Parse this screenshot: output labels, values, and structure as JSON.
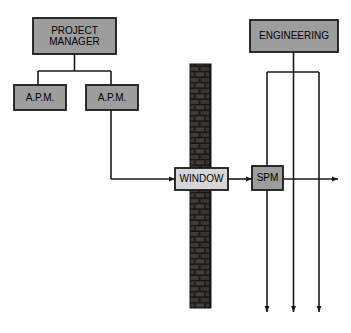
{
  "diagram": {
    "colors": {
      "box_fill": "#9d9d9d",
      "window_fill": "#d6d6d6",
      "stroke": "#1a1a1a",
      "wall_dark": "#1c1a19",
      "wall_brick": "#3a3533",
      "background": "#ffffff"
    },
    "nodes": [
      {
        "id": "project-manager",
        "label": "PROJECT\nMANAGER",
        "x": 33,
        "y": 18,
        "w": 83,
        "h": 36,
        "fill": "#9d9d9d"
      },
      {
        "id": "apm-left",
        "label": "A.P.M.",
        "x": 14,
        "y": 85,
        "w": 52,
        "h": 25,
        "fill": "#9d9d9d"
      },
      {
        "id": "apm-right",
        "label": "A.P.M.",
        "x": 86,
        "y": 85,
        "w": 52,
        "h": 25,
        "fill": "#9d9d9d"
      },
      {
        "id": "window",
        "label": "WINDOW",
        "x": 175,
        "y": 168,
        "w": 53,
        "h": 22,
        "fill": "#d6d6d6"
      },
      {
        "id": "spm",
        "label": "SPM",
        "x": 252,
        "y": 166,
        "w": 31,
        "h": 24,
        "fill": "#9d9d9d"
      },
      {
        "id": "engineering",
        "label": "ENGINEERING",
        "x": 250,
        "y": 20,
        "w": 88,
        "h": 32,
        "fill": "#9d9d9d"
      }
    ],
    "wall": {
      "id": "brick-wall",
      "x": 190,
      "y": 64,
      "w": 21,
      "h": 244
    },
    "connections": [
      {
        "id": "pm-to-apm-bus",
        "from": "project-manager",
        "to": "apm-bus"
      },
      {
        "id": "apm-left-stem",
        "from": "apm-bus",
        "to": "apm-left"
      },
      {
        "id": "apm-right-stem",
        "from": "apm-bus",
        "to": "apm-right"
      },
      {
        "id": "apm-right-to-window",
        "from": "apm-right",
        "to": "window",
        "arrow": true
      },
      {
        "id": "window-to-spm",
        "from": "window",
        "to": "spm",
        "arrow": true
      },
      {
        "id": "spm-to-right",
        "from": "spm",
        "to": "right-edge",
        "arrow": true
      },
      {
        "id": "engineering-to-bus",
        "from": "engineering",
        "to": "eng-bus"
      },
      {
        "id": "eng-drop-left",
        "from": "eng-bus",
        "to": "bottom",
        "arrow": true
      },
      {
        "id": "eng-drop-center",
        "from": "eng-bus",
        "to": "bottom",
        "arrow": true
      },
      {
        "id": "eng-drop-right",
        "from": "eng-bus",
        "to": "bottom",
        "arrow": true
      }
    ]
  }
}
